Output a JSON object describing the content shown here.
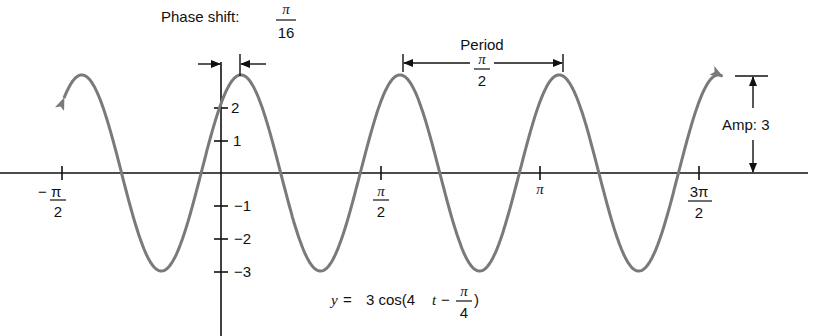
{
  "chart_data": {
    "type": "line",
    "title": "",
    "equation": "y = 3 cos(4t − π/4)",
    "equation_parts": {
      "lhs": "y",
      "eq": "=",
      "coef": "3 cos(4",
      "var": "t",
      "minus": "−",
      "frac_num": "π",
      "frac_den": "4",
      "close": ")"
    },
    "xlabel": "",
    "ylabel": "",
    "xlim": [
      -2.0,
      5.6
    ],
    "ylim": [
      -3,
      3
    ],
    "grid": false,
    "x_ticks": [
      {
        "value": -1.5708,
        "num": "− π",
        "den": "2"
      },
      {
        "value": 1.5708,
        "num": "π",
        "den": "2"
      },
      {
        "value": 3.1416,
        "label": "π"
      },
      {
        "value": 4.7124,
        "num": "3π",
        "den": "2"
      }
    ],
    "y_ticks": [
      {
        "value": 2,
        "label": "2"
      },
      {
        "value": 1,
        "label": "1"
      },
      {
        "value": -1,
        "label": "−1"
      },
      {
        "value": -2,
        "label": "−2"
      },
      {
        "value": -3,
        "label": "−3"
      }
    ],
    "series": [
      {
        "name": "y = 3cos(4t − π/4)",
        "amplitude": 3,
        "frequency": 4,
        "phase": 0.7854,
        "t_range": [
          -1.55,
          4.95
        ],
        "color": "#7a7a7a",
        "peaks_t": [
          0.19635,
          1.76715,
          3.33794
        ],
        "troughs_t": [
          -0.58905,
          0.98175,
          2.55254,
          4.12334
        ]
      }
    ],
    "annotations": {
      "phase_shift": {
        "label": "Phase shift:",
        "num": "π",
        "den": "16"
      },
      "period": {
        "label": "Period",
        "num": "π",
        "den": "2"
      },
      "amplitude": {
        "label": "Amp: 3"
      }
    }
  },
  "colors": {
    "axis": "#111111",
    "curve": "#7a7a7a",
    "background": "#ffffff"
  }
}
